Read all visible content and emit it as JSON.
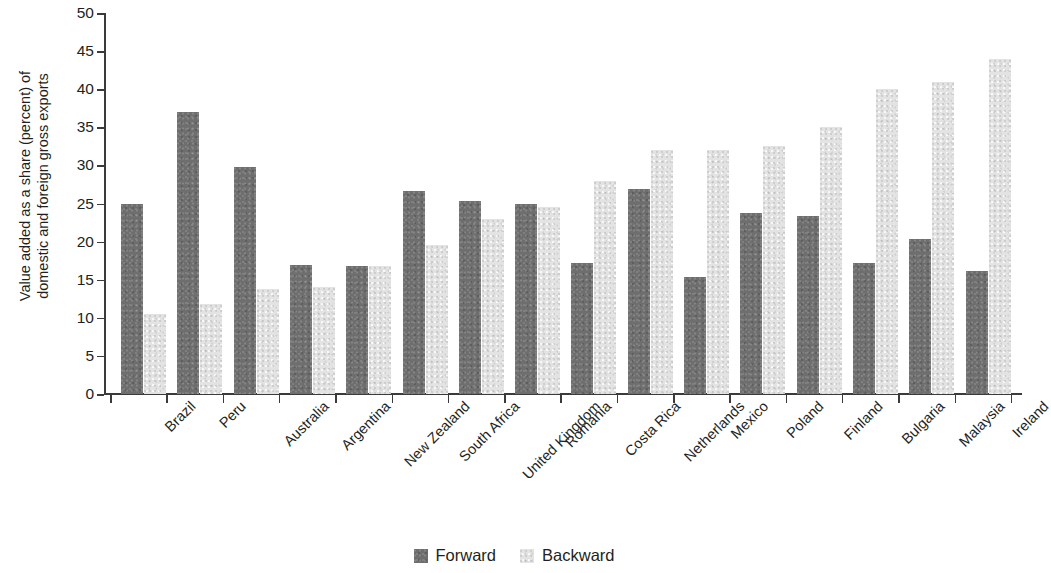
{
  "chart_data": {
    "type": "bar",
    "title": "",
    "xlabel": "",
    "ylabel": "Value added as a share (percent) of\ndomestic and foreign gross exports",
    "ylim": [
      0,
      50
    ],
    "yticks": [
      0,
      5,
      10,
      15,
      20,
      25,
      30,
      35,
      40,
      45,
      50
    ],
    "grid": false,
    "legend_position": "bottom",
    "categories": [
      "Brazil",
      "Peru",
      "Australia",
      "Argentina",
      "New Zealand",
      "South Africa",
      "United Kingdom",
      "Romania",
      "Costa Rica",
      "Netherlands",
      "Mexico",
      "Poland",
      "Finland",
      "Bulgaria",
      "Malaysia",
      "Ireland"
    ],
    "series": [
      {
        "name": "Forward",
        "color": "#6e6e6e",
        "values": [
          25.0,
          37.0,
          29.8,
          16.9,
          16.8,
          26.7,
          25.3,
          25.0,
          17.2,
          26.9,
          15.4,
          23.8,
          23.3,
          17.2,
          20.3,
          16.2
        ]
      },
      {
        "name": "Backward",
        "color": "#e3e3e3",
        "values": [
          10.5,
          11.8,
          13.8,
          14.1,
          16.8,
          19.6,
          23.0,
          24.5,
          28.0,
          32.0,
          32.0,
          32.5,
          35.0,
          40.0,
          41.0,
          44.0
        ]
      }
    ]
  },
  "legend": {
    "items": [
      {
        "label": "Forward",
        "color": "#6e6e6e"
      },
      {
        "label": "Backward",
        "color": "#e3e3e3"
      }
    ]
  },
  "axis": {
    "y_title_line1": "Value added as a share (percent) of",
    "y_title_line2": "domestic and foreign gross exports"
  }
}
